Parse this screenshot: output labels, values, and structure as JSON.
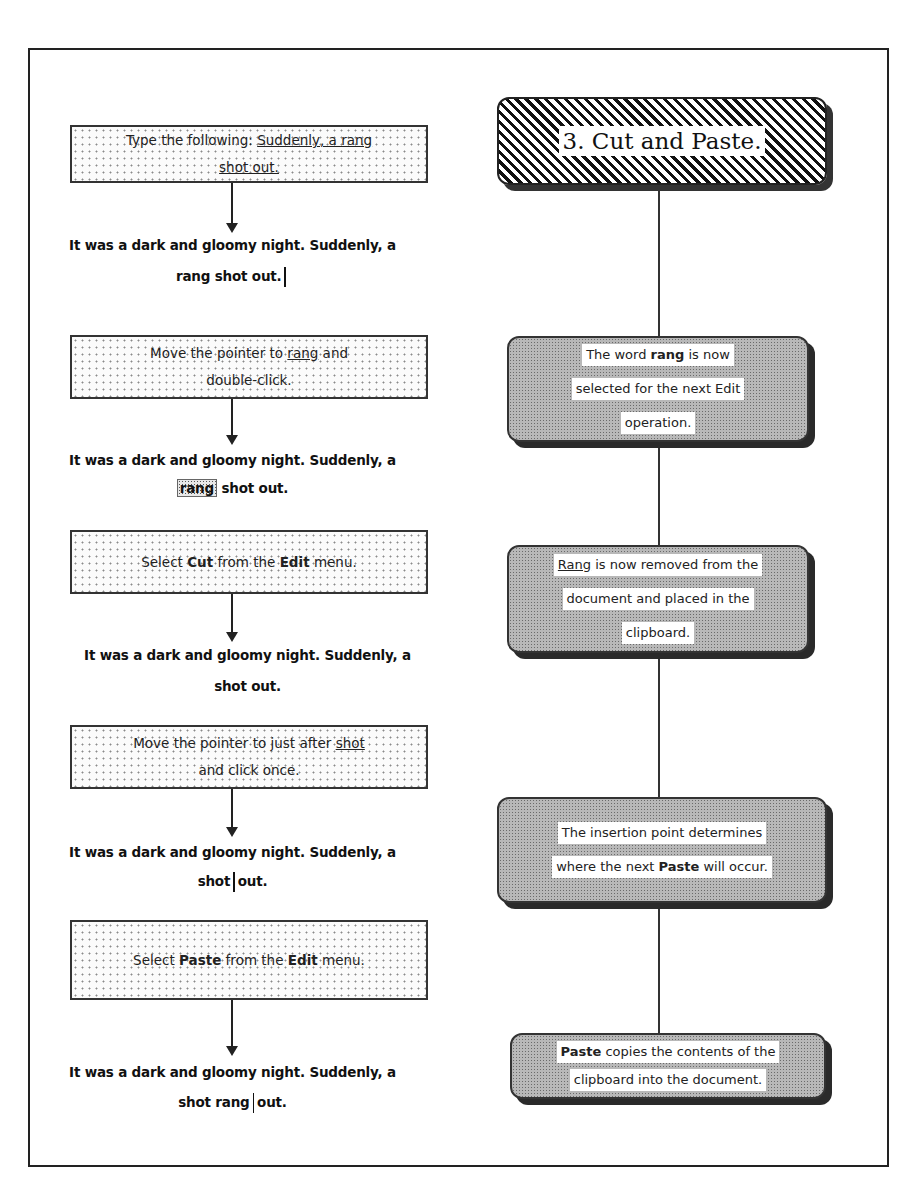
{
  "title": "3. Cut and Paste.",
  "steps": [
    {
      "instruction": {
        "line1_prefix": "Type the following: ",
        "line1_underlined": "Suddenly, a rang",
        "line2_underlined": "shot out."
      },
      "result": {
        "line1": "It was a dark and gloomy night. Suddenly, a",
        "line2": "rang shot out."
      }
    },
    {
      "instruction": {
        "line1_prefix": "Move the pointer to ",
        "line1_underlined": "rang",
        "line1_suffix": " and",
        "line2": "double-click."
      },
      "result": {
        "line1": "It was a dark and gloomy night. Suddenly, a",
        "line2_selected": "rang",
        "line2_rest": " shot out."
      }
    },
    {
      "instruction": {
        "prefix": "Select ",
        "bold1": "Cut",
        "middle": " from the ",
        "bold2": "Edit",
        "suffix": " menu."
      },
      "result": {
        "line1": "It was a dark and gloomy night. Suddenly, a",
        "line2": "shot out."
      }
    },
    {
      "instruction": {
        "line1_prefix": "Move the pointer to just after ",
        "line1_underlined": "shot",
        "line2": "and click once."
      },
      "result": {
        "line1": "It was a dark and gloomy night. Suddenly, a",
        "line2_before": "shot",
        "line2_after": "out."
      }
    },
    {
      "instruction": {
        "prefix": "Select ",
        "bold1": "Paste",
        "middle": " from the ",
        "bold2": "Edit",
        "suffix": " menu."
      },
      "result": {
        "line1": "It was a dark and gloomy night. Suddenly, a",
        "line2_before": "shot rang",
        "line2_after": "out."
      }
    }
  ],
  "notes": [
    {
      "line1_prefix": "The word ",
      "line1_bold": "rang",
      "line1_suffix": " is now",
      "line2": "selected for the next Edit",
      "line3": "operation."
    },
    {
      "line1_underlined": "Rang",
      "line1_suffix": " is now removed from  the",
      "line2": "document and placed in the",
      "line3": "clipboard."
    },
    {
      "line1": "The insertion point determines",
      "line2_prefix": "where the next ",
      "line2_bold": "Paste",
      "line2_suffix": " will occur."
    },
    {
      "line1_bold": "Paste",
      "line1_suffix": " copies the contents of the",
      "line2": "clipboard into the document."
    }
  ]
}
